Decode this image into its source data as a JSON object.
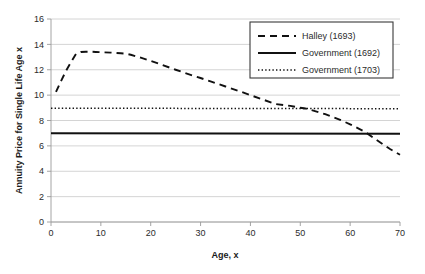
{
  "chart_data": {
    "type": "line",
    "title": "",
    "xlabel": "Age, x",
    "ylabel": "Annuity Price for Single Life Age x",
    "xlim": [
      0,
      70
    ],
    "ylim": [
      0,
      16
    ],
    "xticks": [
      0,
      10,
      20,
      30,
      40,
      50,
      60,
      70
    ],
    "yticks": [
      0,
      2,
      4,
      6,
      8,
      10,
      12,
      14,
      16
    ],
    "grid": "horizontal",
    "legend_position": "top-right",
    "colors": {
      "series": "#111111",
      "gridline": "#c9c9c9",
      "axis": "#9a9a9a",
      "text": "#2b2b2b",
      "background": "#ffffff"
    },
    "series": [
      {
        "name": "Halley (1693)",
        "style": "dashed",
        "x": [
          1,
          2,
          3,
          4,
          5,
          6,
          7,
          8,
          9,
          10,
          12,
          14,
          15,
          16,
          18,
          20,
          22,
          25,
          28,
          30,
          32,
          35,
          38,
          40,
          42,
          45,
          48,
          50,
          51,
          52,
          55,
          58,
          60,
          62,
          63,
          65,
          68,
          70
        ],
        "values": [
          10.25,
          11.1,
          11.9,
          12.6,
          13.25,
          13.4,
          13.42,
          13.42,
          13.4,
          13.38,
          13.35,
          13.3,
          13.27,
          13.18,
          12.95,
          12.7,
          12.42,
          12.0,
          11.6,
          11.35,
          11.08,
          10.68,
          10.28,
          10.0,
          9.72,
          9.3,
          9.15,
          9.0,
          8.95,
          8.85,
          8.5,
          8.05,
          7.7,
          7.3,
          7.1,
          6.55,
          5.75,
          5.3
        ]
      },
      {
        "name": "Government (1692)",
        "style": "solid",
        "x": [
          0,
          70
        ],
        "values": [
          7.0,
          6.95
        ]
      },
      {
        "name": "Government (1703)",
        "style": "dotted",
        "x": [
          0,
          70
        ],
        "values": [
          8.97,
          8.93
        ]
      }
    ],
    "annotations": []
  },
  "legend": {
    "entries": [
      {
        "label": "Halley (1693)",
        "style": "dashed"
      },
      {
        "label": "Government (1692)",
        "style": "solid"
      },
      {
        "label": "Government (1703)",
        "style": "dotted"
      }
    ]
  }
}
